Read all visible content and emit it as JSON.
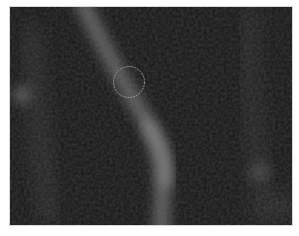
{
  "image": {
    "kind": "fluorescence micrograph",
    "background_color": "#141414",
    "page_background": "#ffffff",
    "roi_marker": {
      "shape": "circle",
      "center_x": 129,
      "center_y": 82,
      "radius": 16,
      "color": "#9a9a9a",
      "style": "dashed"
    }
  }
}
